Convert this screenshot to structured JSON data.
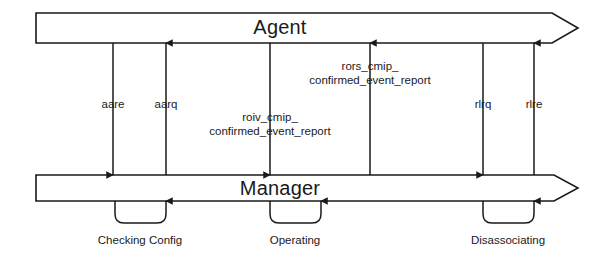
{
  "diagram": {
    "line_color": "#1a1a1a",
    "background_color": "#ffffff"
  },
  "lanes": [
    {
      "id": "agent",
      "label": "Agent",
      "x": 36,
      "y": 13,
      "width": 542,
      "height": 30,
      "notch": 26
    },
    {
      "id": "manager",
      "label": "Manager",
      "x": 36,
      "y": 175,
      "width": 542,
      "height": 26,
      "notch": 24
    }
  ],
  "messages": [
    {
      "id": "aare",
      "label": "aare",
      "lines": [
        "aare"
      ],
      "x": 113,
      "direction": "down",
      "from": "agent",
      "to": "manager",
      "label_y": 97
    },
    {
      "id": "aarq",
      "label": "aarq",
      "lines": [
        "aarq"
      ],
      "x": 166,
      "direction": "up",
      "from": "manager",
      "to": "agent",
      "label_y": 97
    },
    {
      "id": "roiv_cmip_confirmed_event_report",
      "label": "roiv_cmip_ confirmed_event_report",
      "lines": [
        "roiv_cmip_",
        "confirmed_event_report"
      ],
      "x": 270,
      "direction": "down",
      "from": "agent",
      "to": "manager",
      "label_y": 110
    },
    {
      "id": "rors_cmip_confirmed_event_report",
      "label": "rors_cmip_ confirmed_event_report",
      "lines": [
        "rors_cmip_",
        "confirmed_event_report"
      ],
      "x": 370,
      "direction": "up",
      "from": "manager",
      "to": "agent",
      "label_y": 59
    },
    {
      "id": "rlrq",
      "label": "rlrq",
      "lines": [
        "rlrq"
      ],
      "x": 483,
      "direction": "down",
      "from": "agent",
      "to": "manager",
      "label_y": 97
    },
    {
      "id": "rlre",
      "label": "rlre",
      "lines": [
        "rlre"
      ],
      "x": 534,
      "direction": "up",
      "from": "manager",
      "to": "agent",
      "label_y": 97
    }
  ],
  "states": [
    {
      "id": "checking-config",
      "label": "Checking Config",
      "start_x": 115,
      "end_x": 166,
      "center_x": 140,
      "label_y": 234
    },
    {
      "id": "operating",
      "label": "Operating",
      "start_x": 270,
      "end_x": 321,
      "center_x": 295,
      "label_y": 234
    },
    {
      "id": "disassociating",
      "label": "Disassociating",
      "start_x": 483,
      "end_x": 534,
      "center_x": 508,
      "label_y": 234
    }
  ]
}
